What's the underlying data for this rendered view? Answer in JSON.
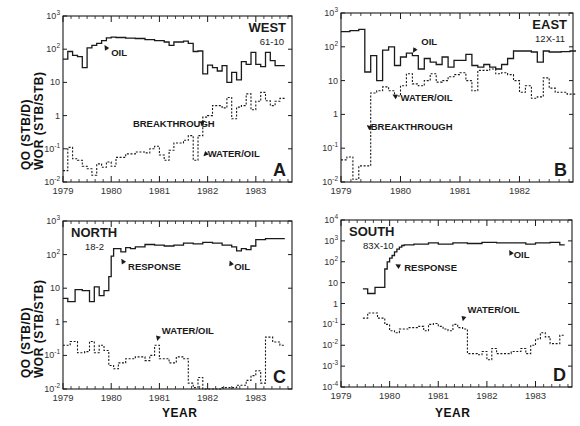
{
  "figure": {
    "ylabel_line1": "QO (STB/D)",
    "ylabel_line2": "WOR (STB/STB)",
    "xlabel": "YEAR",
    "ink_color": "#1a1a1a",
    "background": "#ffffff"
  },
  "chart_data": [
    {
      "type": "line",
      "panel": "A",
      "title": "WEST",
      "subtitle": "61-10",
      "xlabel": "",
      "ylabel": "QO (STB/D) / WOR (STB/STB)",
      "yscale": "log",
      "ylim_exp": [
        -2,
        3
      ],
      "ytick_labels": [
        "10-2",
        "10-1",
        "1",
        "10",
        "102",
        "103"
      ],
      "xlim": [
        1979,
        1983.75
      ],
      "xtick_labels": [
        "1979",
        "1980",
        "1981",
        "1982",
        "1983"
      ],
      "frame": {
        "x": 63,
        "y": 16,
        "w": 229,
        "h": 166
      },
      "annotations": [
        {
          "text": "OIL",
          "x": 1980.0,
          "y_exp": 1.8,
          "arrow_to": [
            1979.85,
            2.15
          ]
        },
        {
          "text": "BREAKTHROUGH",
          "x": 1980.45,
          "y_exp": -0.35,
          "arrow_to": [
            1981.8,
            -0.18
          ]
        },
        {
          "text": "WATER/OIL",
          "x": 1982.0,
          "y_exp": -1.25,
          "arrow_to": [
            1981.9,
            -1.25
          ]
        }
      ],
      "series": [
        {
          "name": "OIL",
          "style": "solid",
          "x": [
            1979.0,
            1979.1,
            1979.2,
            1979.3,
            1979.4,
            1979.5,
            1979.6,
            1979.7,
            1979.8,
            1979.9,
            1980.0,
            1980.1,
            1980.3,
            1980.5,
            1980.7,
            1980.9,
            1981.1,
            1981.2,
            1981.3,
            1981.5,
            1981.6,
            1981.7,
            1981.8,
            1981.9,
            1982.0,
            1982.1,
            1982.2,
            1982.3,
            1982.4,
            1982.5,
            1982.6,
            1982.7,
            1982.8,
            1982.9,
            1983.0,
            1983.1,
            1983.2,
            1983.3,
            1983.4,
            1983.5
          ],
          "values": [
            50,
            85,
            65,
            60,
            28,
            110,
            130,
            150,
            180,
            220,
            230,
            225,
            215,
            210,
            195,
            180,
            165,
            130,
            165,
            175,
            150,
            85,
            88,
            18,
            33,
            28,
            22,
            32,
            10,
            20,
            12,
            42,
            35,
            80,
            35,
            30,
            80,
            45,
            32,
            32
          ]
        },
        {
          "name": "WATER/OIL",
          "style": "dashed",
          "x": [
            1979.0,
            1979.1,
            1979.2,
            1979.3,
            1979.4,
            1979.5,
            1979.6,
            1979.7,
            1979.8,
            1979.9,
            1980.0,
            1980.1,
            1980.3,
            1980.5,
            1980.7,
            1980.8,
            1980.9,
            1981.0,
            1981.1,
            1981.2,
            1981.3,
            1981.5,
            1981.6,
            1981.7,
            1981.8,
            1981.9,
            1982.0,
            1982.1,
            1982.3,
            1982.4,
            1982.5,
            1982.6,
            1982.7,
            1982.8,
            1982.9,
            1983.0,
            1983.1,
            1983.2,
            1983.3,
            1983.4,
            1983.5
          ],
          "values": [
            0.022,
            0.11,
            0.05,
            0.045,
            0.03,
            0.025,
            0.016,
            0.035,
            0.028,
            0.04,
            0.03,
            0.055,
            0.07,
            0.08,
            0.075,
            0.1,
            0.12,
            0.065,
            0.045,
            0.09,
            0.15,
            0.18,
            0.25,
            0.045,
            0.25,
            0.9,
            1.0,
            2.0,
            1.7,
            3.5,
            0.8,
            1.8,
            2.0,
            4.5,
            1.5,
            2.7,
            5.0,
            2.8,
            2.0,
            2.7,
            3.3
          ]
        }
      ]
    },
    {
      "type": "line",
      "panel": "B",
      "title": "EAST",
      "subtitle": "12X-11",
      "xlabel": "",
      "ylabel": "",
      "yscale": "log",
      "ylim_exp": [
        -2,
        3
      ],
      "ytick_labels": [
        "10-2",
        "10-1",
        "1",
        "10",
        "102",
        "103"
      ],
      "xlim": [
        1979,
        1982.9
      ],
      "xtick_labels": [
        "1979",
        "1980",
        "1981",
        "1982"
      ],
      "frame": {
        "x": 341,
        "y": 13,
        "w": 232,
        "h": 169
      },
      "annotations": [
        {
          "text": "OIL",
          "x": 1980.35,
          "y_exp": 2.05,
          "arrow_to": [
            1980.2,
            1.8
          ]
        },
        {
          "text": "WATER/OIL",
          "x": 1980.0,
          "y_exp": 0.4,
          "arrow_to": [
            1979.85,
            0.6
          ]
        },
        {
          "text": "BREAKTHROUGH",
          "x": 1979.5,
          "y_exp": -0.45,
          "arrow_to": [
            1979.42,
            -0.3
          ]
        }
      ],
      "series": [
        {
          "name": "OIL",
          "style": "solid",
          "x": [
            1979.0,
            1979.15,
            1979.3,
            1979.4,
            1979.5,
            1979.6,
            1979.7,
            1979.8,
            1979.9,
            1980.0,
            1980.1,
            1980.2,
            1980.3,
            1980.4,
            1980.5,
            1980.6,
            1980.7,
            1980.8,
            1980.9,
            1981.0,
            1981.1,
            1981.2,
            1981.3,
            1981.4,
            1981.5,
            1981.6,
            1981.7,
            1981.8,
            1981.9,
            1982.0,
            1982.2,
            1982.3,
            1982.4,
            1982.5,
            1982.7,
            1982.85
          ],
          "values": [
            280,
            300,
            330,
            18,
            55,
            10,
            80,
            100,
            28,
            50,
            65,
            55,
            22,
            45,
            35,
            30,
            50,
            25,
            40,
            40,
            60,
            28,
            25,
            30,
            25,
            22,
            30,
            45,
            75,
            75,
            70,
            35,
            75,
            70,
            72,
            75
          ]
        },
        {
          "name": "WATER/OIL",
          "style": "dashed",
          "x": [
            1979.0,
            1979.1,
            1979.2,
            1979.3,
            1979.4,
            1979.5,
            1979.6,
            1979.7,
            1979.8,
            1979.9,
            1980.0,
            1980.1,
            1980.2,
            1980.3,
            1980.4,
            1980.5,
            1980.6,
            1980.7,
            1980.8,
            1980.9,
            1981.0,
            1981.1,
            1981.2,
            1981.3,
            1981.5,
            1981.6,
            1981.7,
            1981.8,
            1981.9,
            1982.0,
            1982.1,
            1982.2,
            1982.3,
            1982.4,
            1982.5,
            1982.6,
            1982.8,
            1982.85
          ],
          "values": [
            0.045,
            0.055,
            0.012,
            0.03,
            0.03,
            4.3,
            5,
            6.5,
            5,
            3.5,
            7,
            16,
            8,
            7,
            10,
            16,
            9,
            10,
            13,
            15,
            17,
            10,
            5,
            20,
            22,
            16,
            17,
            15,
            10,
            4.5,
            7,
            3,
            3.3,
            12,
            6,
            4.5,
            4,
            4
          ]
        }
      ]
    },
    {
      "type": "line",
      "panel": "C",
      "title": "NORTH",
      "subtitle": "18-2",
      "xlabel": "YEAR",
      "ylabel": "QO (STB/D) / WOR (STB/STB)",
      "yscale": "log",
      "ylim_exp": [
        -2,
        3
      ],
      "ytick_labels": [
        "10-2",
        "10-1",
        "1",
        "10",
        "102",
        "103"
      ],
      "xlim": [
        1979,
        1983.75
      ],
      "xtick_labels": [
        "1979",
        "1980",
        "1981",
        "1982",
        "1983"
      ],
      "frame": {
        "x": 63,
        "y": 221,
        "w": 229,
        "h": 168
      },
      "annotations": [
        {
          "text": "RESPONSE",
          "x": 1980.35,
          "y_exp": 1.55,
          "arrow_to": [
            1980.2,
            1.9
          ]
        },
        {
          "text": "OIL",
          "x": 1982.55,
          "y_exp": 1.55,
          "arrow_to": [
            1982.45,
            1.85
          ]
        },
        {
          "text": "WATER/OIL",
          "x": 1981.05,
          "y_exp": -0.35,
          "arrow_to": [
            1980.95,
            -0.6
          ]
        }
      ],
      "series": [
        {
          "name": "OIL",
          "style": "solid",
          "x": [
            1979.0,
            1979.1,
            1979.25,
            1979.4,
            1979.55,
            1979.65,
            1979.75,
            1979.85,
            1979.95,
            1980.0,
            1980.05,
            1980.1,
            1980.2,
            1980.3,
            1980.4,
            1980.5,
            1980.7,
            1980.9,
            1981.1,
            1981.3,
            1981.5,
            1981.7,
            1981.9,
            1982.1,
            1982.3,
            1982.5,
            1982.6,
            1982.7,
            1982.8,
            1982.9,
            1983.0,
            1983.2,
            1983.5
          ],
          "values": [
            5,
            4,
            9,
            8.5,
            4,
            11,
            6,
            8.5,
            22,
            90,
            150,
            150,
            120,
            160,
            150,
            170,
            200,
            190,
            180,
            190,
            220,
            210,
            230,
            220,
            190,
            170,
            130,
            150,
            140,
            180,
            280,
            300,
            300
          ]
        },
        {
          "name": "WATER/OIL",
          "style": "dashed",
          "x": [
            1979.0,
            1979.15,
            1979.3,
            1979.45,
            1979.55,
            1979.65,
            1979.75,
            1979.85,
            1979.95,
            1980.05,
            1980.15,
            1980.3,
            1980.5,
            1980.7,
            1980.8,
            1980.9,
            1981.0,
            1981.2,
            1981.35,
            1981.5,
            1981.6,
            1981.7,
            1981.8,
            1981.9,
            1982.0,
            1982.3,
            1982.6,
            1982.8,
            1982.9,
            1983.0,
            1983.1,
            1983.2,
            1983.35,
            1983.5
          ],
          "values": [
            0.2,
            0.26,
            0.12,
            0.13,
            0.26,
            0.12,
            0.2,
            0.14,
            0.05,
            0.04,
            0.06,
            0.08,
            0.09,
            0.07,
            0.1,
            0.2,
            0.08,
            0.06,
            0.09,
            0.08,
            0.015,
            0.011,
            0.022,
            0.01,
            0.01,
            0.011,
            0.013,
            0.018,
            0.025,
            0.035,
            0.015,
            0.35,
            0.25,
            0.2
          ]
        }
      ]
    },
    {
      "type": "line",
      "panel": "D",
      "title": "SOUTH",
      "subtitle": "83X-10",
      "xlabel": "YEAR",
      "ylabel": "",
      "yscale": "log",
      "ylim_exp": [
        -4,
        4
      ],
      "ytick_labels": [
        "10-4",
        "10-3",
        "10-2",
        "10-1",
        "1",
        "10",
        "102",
        "103",
        "104"
      ],
      "xlim": [
        1979,
        1983.75
      ],
      "xtick_labels": [
        "1979",
        "1980",
        "1981",
        "1982",
        "1983"
      ],
      "frame": {
        "x": 341,
        "y": 220,
        "w": 231,
        "h": 167
      },
      "annotations": [
        {
          "text": "RESPONSE",
          "x": 1980.3,
          "y_exp": 1.55,
          "arrow_to": [
            1980.1,
            1.9
          ]
        },
        {
          "text": "OIL",
          "x": 1982.55,
          "y_exp": 2.2,
          "arrow_to": [
            1982.45,
            2.6
          ]
        },
        {
          "text": "WATER/OIL",
          "x": 1981.6,
          "y_exp": -0.45,
          "arrow_to": [
            1981.5,
            -0.9
          ]
        }
      ],
      "series": [
        {
          "name": "OIL",
          "style": "solid",
          "x": [
            1979.45,
            1979.55,
            1979.7,
            1979.9,
            1979.95,
            1980.0,
            1980.05,
            1980.1,
            1980.15,
            1980.2,
            1980.25,
            1980.3,
            1980.5,
            1980.8,
            1981.0,
            1981.3,
            1981.6,
            1981.9,
            1982.2,
            1982.5,
            1982.8,
            1983.0,
            1983.3,
            1983.5
          ],
          "values": [
            5,
            3,
            6,
            45,
            100,
            150,
            200,
            300,
            400,
            500,
            600,
            650,
            700,
            800,
            700,
            800,
            750,
            850,
            800,
            800,
            700,
            800,
            850,
            650
          ]
        },
        {
          "name": "WATER/OIL",
          "style": "dashed",
          "x": [
            1979.45,
            1979.55,
            1979.75,
            1979.9,
            1980.0,
            1980.1,
            1980.2,
            1980.4,
            1980.6,
            1980.7,
            1980.8,
            1980.9,
            1981.0,
            1981.1,
            1981.2,
            1981.3,
            1981.4,
            1981.5,
            1981.6,
            1981.8,
            1981.9,
            1982.0,
            1982.1,
            1982.2,
            1982.4,
            1982.5,
            1982.7,
            1982.8,
            1982.9,
            1983.0,
            1983.1,
            1983.2,
            1983.3,
            1983.5
          ],
          "values": [
            0.2,
            0.35,
            0.2,
            0.1,
            0.05,
            0.04,
            0.06,
            0.07,
            0.08,
            0.05,
            0.1,
            0.11,
            0.08,
            0.06,
            0.05,
            0.1,
            0.07,
            0.06,
            0.004,
            0.0035,
            0.005,
            0.002,
            0.007,
            0.004,
            0.004,
            0.005,
            0.007,
            0.004,
            0.01,
            0.02,
            0.04,
            0.025,
            0.012,
            0.03
          ]
        }
      ]
    }
  ]
}
